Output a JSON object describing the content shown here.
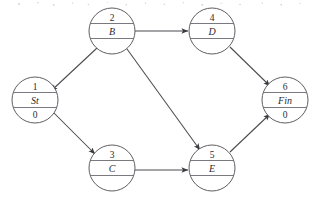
{
  "diagram": {
    "type": "directed-graph",
    "canvas": {
      "width": 316,
      "height": 202
    },
    "node_radius": 23,
    "nodes": [
      {
        "key": "n1",
        "id": "1",
        "label": "St",
        "value": "0",
        "cx": 35,
        "cy": 100,
        "sections": 3
      },
      {
        "key": "n2",
        "id": "2",
        "label": "B",
        "value": "",
        "cx": 112,
        "cy": 31,
        "sections": 3
      },
      {
        "key": "n3",
        "id": "3",
        "label": "C",
        "value": "",
        "cx": 112,
        "cy": 168,
        "sections": 3
      },
      {
        "key": "n4",
        "id": "4",
        "label": "D",
        "value": "",
        "cx": 212,
        "cy": 31,
        "sections": 3
      },
      {
        "key": "n5",
        "id": "5",
        "label": "E",
        "value": "",
        "cx": 212,
        "cy": 168,
        "sections": 3
      },
      {
        "key": "n6",
        "id": "6",
        "label": "Fin",
        "value": "0",
        "cx": 285,
        "cy": 100,
        "sections": 3
      }
    ],
    "edges": [
      {
        "key": "e21",
        "from": "2",
        "to": "1",
        "x1": 97,
        "y1": 48,
        "x2": 51,
        "y2": 91,
        "arrow": true
      },
      {
        "key": "e13",
        "from": "1",
        "to": "3",
        "x1": 51,
        "y1": 110,
        "x2": 95,
        "y2": 154,
        "arrow": true
      },
      {
        "key": "e24",
        "from": "2",
        "to": "4",
        "x1": 135,
        "y1": 31,
        "x2": 188,
        "y2": 31,
        "arrow": true
      },
      {
        "key": "e35",
        "from": "3",
        "to": "5",
        "x1": 135,
        "y1": 170,
        "x2": 188,
        "y2": 170,
        "arrow": true
      },
      {
        "key": "e25",
        "from": "2",
        "to": "5",
        "x1": 127,
        "y1": 49,
        "x2": 200,
        "y2": 150,
        "arrow": true
      },
      {
        "key": "e46",
        "from": "4",
        "to": "6",
        "x1": 230,
        "y1": 47,
        "x2": 270,
        "y2": 86,
        "arrow": true
      },
      {
        "key": "e56",
        "from": "5",
        "to": "6",
        "x1": 230,
        "y1": 152,
        "x2": 270,
        "y2": 114,
        "arrow": true
      }
    ],
    "colors": {
      "stroke": "#55555a",
      "edge": "#4a4a4f",
      "text": "#2b2b30",
      "background": "#ffffff"
    }
  }
}
